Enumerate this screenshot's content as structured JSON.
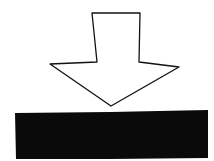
{
  "illustration": {
    "description": "Hand-drawn outlined down arrow pointing to a solid black bar",
    "arrow": {
      "icon": "arrow-down-icon",
      "fill": "#ffffff",
      "stroke": "#111111",
      "points": "92,13 140,13 139,62 179,67 111,106 50,64 97,62"
    },
    "bar": {
      "icon": "bar-icon",
      "fill": "#0a0a0a",
      "points": "15,113 110,112 208,110 208,158 110,159 16,159"
    },
    "background": "#ffffff"
  }
}
